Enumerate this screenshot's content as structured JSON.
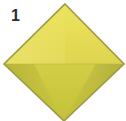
{
  "figure": {
    "label": "1",
    "label_color": "#2b2b2b",
    "background_color": "#ffffff",
    "shape": {
      "name": "diamond",
      "description": "yellow rhombus / diamond viewed face-on, bottom vertex clipped by image edge",
      "vertices": {
        "top": [
          65,
          4
        ],
        "right": [
          124,
          64
        ],
        "bottom": [
          64,
          121
        ],
        "left": [
          4,
          64
        ]
      },
      "upper_face_color": "#e6dc55",
      "lower_face_color": "#cbc83f",
      "outline_color": "#9d9a44",
      "outline_width": 1.5,
      "edge_shadow_color": "#a9a63b",
      "highlight_color": "#efe870",
      "split_line_y": 64
    }
  }
}
